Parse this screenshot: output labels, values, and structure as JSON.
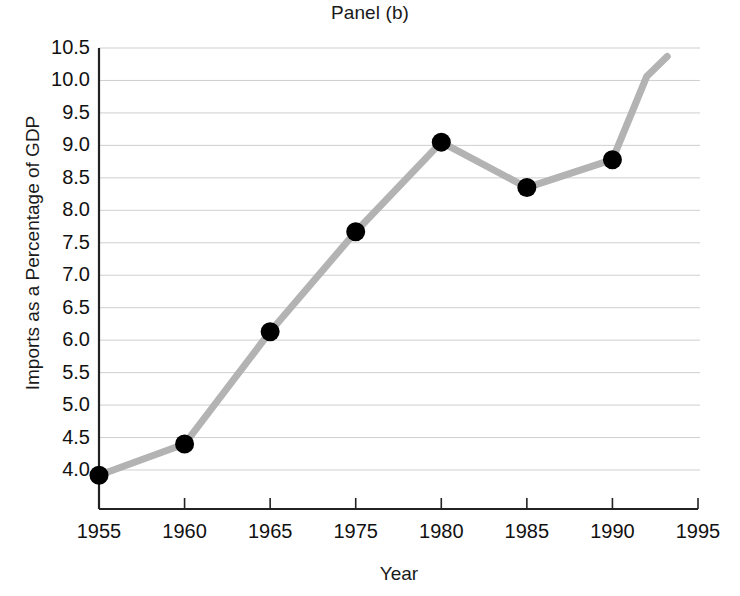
{
  "chart_data": {
    "type": "line",
    "title": "Panel (b)",
    "xlabel": "Year",
    "ylabel": "Imports as a Percentage of GDP",
    "grid": true,
    "legend": "none",
    "xtick_labels": [
      "1955",
      "1960",
      "1965",
      "1975",
      "1980",
      "1985",
      "1990",
      "1995"
    ],
    "ytick_labels": [
      "4.0",
      "4.5",
      "5.0",
      "5.5",
      "6.0",
      "6.5",
      "7.0",
      "7.5",
      "8.0",
      "8.5",
      "9.0",
      "9.5",
      "10.0",
      "10.5"
    ],
    "ylim": [
      3.75,
      10.5
    ],
    "xlim": [
      1955,
      1995
    ],
    "series": [
      {
        "name": "Imports as a Percentage of GDP",
        "marker": "filled-circle",
        "marker_color": "#000000",
        "line_color": "#b3b3b3",
        "points": [
          {
            "x": 1955,
            "y": 3.92,
            "marker": true
          },
          {
            "x": 1960,
            "y": 4.4,
            "marker": true
          },
          {
            "x": 1965,
            "y": 6.13,
            "marker": true
          },
          {
            "x": 1975,
            "y": 7.67,
            "marker": true
          },
          {
            "x": 1980,
            "y": 9.05,
            "marker": true
          },
          {
            "x": 1985,
            "y": 8.35,
            "marker": true
          },
          {
            "x": 1990,
            "y": 8.78,
            "marker": true
          },
          {
            "x": 1992,
            "y": 10.06,
            "marker": false
          },
          {
            "x": 1993.2,
            "y": 10.37,
            "marker": false
          }
        ]
      }
    ]
  },
  "axes": {
    "axis_color": "#222222",
    "grid_color": "#cfcfcf",
    "background": "#ffffff"
  }
}
